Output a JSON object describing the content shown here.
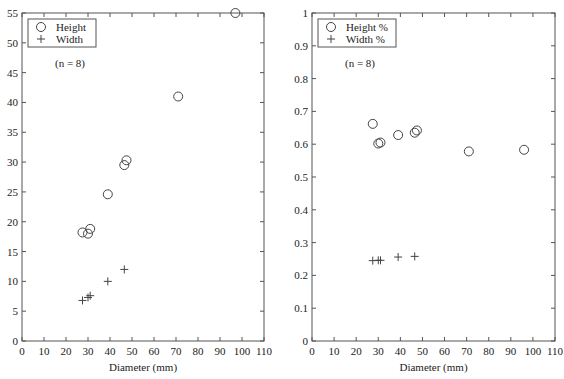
{
  "chart_data": [
    {
      "type": "scatter",
      "title": "",
      "xlabel": "Diameter (mm)",
      "ylabel": "",
      "xlim": [
        0,
        110
      ],
      "ylim": [
        0,
        55
      ],
      "xticks": [
        0,
        10,
        20,
        30,
        40,
        50,
        60,
        70,
        80,
        90,
        100,
        110
      ],
      "yticks": [
        0,
        5,
        10,
        15,
        20,
        25,
        30,
        35,
        40,
        45,
        50,
        55
      ],
      "grid": false,
      "legend_position": "top-left",
      "annotation": "(n = 8)",
      "series": [
        {
          "name": "Height",
          "marker": "circle",
          "x": [
            27.5,
            30,
            31,
            39,
            46.5,
            47.5,
            71,
            97
          ],
          "y": [
            18.2,
            18.0,
            18.8,
            24.6,
            29.5,
            30.3,
            41.0,
            55.0
          ]
        },
        {
          "name": "Width",
          "marker": "plus",
          "x": [
            27.5,
            30,
            31,
            39,
            46.5
          ],
          "y": [
            6.8,
            7.3,
            7.6,
            10.0,
            12.0
          ]
        }
      ]
    },
    {
      "type": "scatter",
      "title": "",
      "xlabel": "Diameter (mm)",
      "ylabel": "",
      "xlim": [
        0,
        110
      ],
      "ylim": [
        0,
        1
      ],
      "xticks": [
        0,
        10,
        20,
        30,
        40,
        50,
        60,
        70,
        80,
        90,
        100,
        110
      ],
      "yticks": [
        0,
        0.1,
        0.2,
        0.3,
        0.4,
        0.5,
        0.6,
        0.7,
        0.8,
        0.9,
        1
      ],
      "grid": false,
      "legend_position": "top-left",
      "annotation": "(n = 8)",
      "series": [
        {
          "name": "Height %",
          "marker": "circle",
          "x": [
            27.5,
            30,
            31,
            39,
            46.5,
            47.5,
            71,
            96
          ],
          "y": [
            0.662,
            0.602,
            0.605,
            0.628,
            0.635,
            0.642,
            0.578,
            0.583
          ]
        },
        {
          "name": "Width %",
          "marker": "plus",
          "x": [
            27.5,
            30,
            31,
            39,
            46.5
          ],
          "y": [
            0.245,
            0.246,
            0.246,
            0.256,
            0.258
          ]
        }
      ]
    }
  ]
}
